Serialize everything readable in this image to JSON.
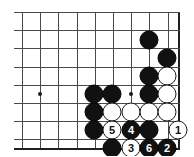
{
  "board": {
    "title": "go-board-diagram",
    "geometry": {
      "origin_x": 22,
      "origin_y": 12,
      "spacing": 18.2,
      "cols": 9,
      "rows": 8
    },
    "colors": {
      "background": "#ffffff",
      "grid": "#4a4a4a",
      "edge": "#202020",
      "black_stone": "#111111",
      "white_stone": "#ffffff",
      "white_stone_border": "#1a1a1a",
      "black_label": "#ffffff",
      "white_label": "#111111"
    },
    "star_points": [
      {
        "name": "star-point-left",
        "x": 40,
        "y": 94
      },
      {
        "name": "star-point-right",
        "x": 131,
        "y": 94
      }
    ],
    "stones": [
      {
        "name": "black-stone-r2c8",
        "color": "black",
        "x": 149,
        "y": 40,
        "label": ""
      },
      {
        "name": "black-stone-r3c9",
        "color": "black",
        "x": 167,
        "y": 58,
        "label": ""
      },
      {
        "name": "black-stone-r4c8",
        "color": "black",
        "x": 149,
        "y": 76,
        "label": ""
      },
      {
        "name": "white-stone-r4c9",
        "color": "white",
        "x": 167,
        "y": 76,
        "label": ""
      },
      {
        "name": "black-stone-r5c5",
        "color": "black",
        "x": 94,
        "y": 94,
        "label": ""
      },
      {
        "name": "black-stone-r5c6",
        "color": "black",
        "x": 112,
        "y": 94,
        "label": ""
      },
      {
        "name": "black-stone-r5c8",
        "color": "black",
        "x": 149,
        "y": 94,
        "label": ""
      },
      {
        "name": "white-stone-r5c9",
        "color": "white",
        "x": 167,
        "y": 94,
        "label": ""
      },
      {
        "name": "black-stone-r6c5",
        "color": "black",
        "x": 94,
        "y": 112,
        "label": ""
      },
      {
        "name": "white-stone-r6c6",
        "color": "white",
        "x": 112,
        "y": 112,
        "label": ""
      },
      {
        "name": "white-stone-r6c7",
        "color": "white",
        "x": 131,
        "y": 112,
        "label": ""
      },
      {
        "name": "white-stone-r6c8",
        "color": "white",
        "x": 149,
        "y": 112,
        "label": ""
      },
      {
        "name": "white-stone-r6c9",
        "color": "white",
        "x": 167,
        "y": 112,
        "label": ""
      },
      {
        "name": "black-stone-r7c5",
        "color": "black",
        "x": 94,
        "y": 130,
        "label": ""
      },
      {
        "name": "move-stone-5",
        "color": "white",
        "x": 112,
        "y": 130,
        "label": "5"
      },
      {
        "name": "move-stone-4",
        "color": "black",
        "x": 131,
        "y": 130,
        "label": "4"
      },
      {
        "name": "black-stone-r7c8",
        "color": "black",
        "x": 149,
        "y": 130,
        "label": ""
      },
      {
        "name": "move-stone-1",
        "color": "white",
        "x": 178,
        "y": 130,
        "label": "1"
      },
      {
        "name": "black-stone-r8c6",
        "color": "black",
        "x": 112,
        "y": 148,
        "label": ""
      },
      {
        "name": "move-stone-3",
        "color": "white",
        "x": 131,
        "y": 148,
        "label": "3"
      },
      {
        "name": "move-stone-6",
        "color": "black",
        "x": 149,
        "y": 148,
        "label": "6"
      },
      {
        "name": "move-stone-2",
        "color": "black",
        "x": 167,
        "y": 148,
        "label": "2"
      }
    ],
    "move_sequence": [
      {
        "number": "1",
        "color": "white"
      },
      {
        "number": "2",
        "color": "black"
      },
      {
        "number": "3",
        "color": "white"
      },
      {
        "number": "4",
        "color": "black"
      },
      {
        "number": "5",
        "color": "white"
      },
      {
        "number": "6",
        "color": "black"
      }
    ]
  }
}
